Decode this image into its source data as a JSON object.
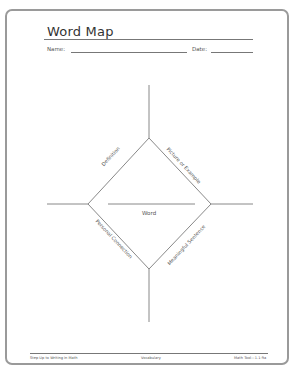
{
  "worksheet": {
    "title": "Word Map",
    "name_label": "Name:",
    "date_label": "Date:"
  },
  "diagram": {
    "center_label": "Word",
    "quadrants": {
      "top_left": "Definition",
      "top_right": "Picture or Example",
      "bottom_left": "Personal Connection",
      "bottom_right": "Meaningful Sentence"
    }
  },
  "footer": {
    "left": "Step Up to Writing in Math",
    "center": "Vocabulary",
    "right": "Math Tool—1.1-9a"
  },
  "colors": {
    "line": "#7a7a7a",
    "text": "#444444",
    "frame": "#9a9a9a"
  }
}
